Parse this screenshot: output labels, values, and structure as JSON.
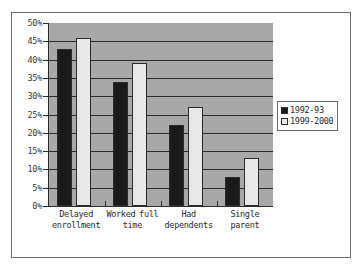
{
  "chart_data": {
    "type": "bar",
    "title": "",
    "xlabel": "",
    "ylabel": "",
    "categories": [
      "Delayed enrollment",
      "Worked full time",
      "Had dependents",
      "Single parent"
    ],
    "series": [
      {
        "name": "1992-93",
        "values": [
          43,
          34,
          22,
          8
        ],
        "color": "#1a1a1a"
      },
      {
        "name": "1999-2000",
        "values": [
          46,
          39,
          27,
          13
        ],
        "color": "#e8e8e8"
      }
    ],
    "ylim": [
      0,
      50
    ],
    "ytick_labels": [
      "50%",
      "45%",
      "40%",
      "35%",
      "30%",
      "25%",
      "20%",
      "15%",
      "10%",
      "5%",
      "0%"
    ],
    "ytick_values": [
      50,
      45,
      40,
      35,
      30,
      25,
      20,
      15,
      10,
      5,
      0
    ],
    "grid": true,
    "legend_position": "right",
    "plot_background": "#a8a8a8",
    "frame_color": "#6e6e6e",
    "axis_color": "#2b2b2b"
  }
}
